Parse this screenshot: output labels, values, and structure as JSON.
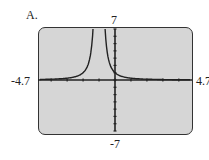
{
  "panel_label": "A.",
  "window": {
    "xmin": "-4.7",
    "xmax": "4.7",
    "ymin": "-7",
    "ymax": "7"
  },
  "colors": {
    "screen_bg": "#d6d6d6",
    "curve": "#222222"
  },
  "chart_data": {
    "type": "line",
    "title": "A.",
    "xlabel": "",
    "ylabel": "",
    "xlim": [
      -4.7,
      4.7
    ],
    "ylim": [
      -7,
      7
    ],
    "tick_labels": {
      "x": [
        "-4.7",
        "4.7"
      ],
      "y": [
        "7",
        "-7"
      ]
    },
    "grid": false,
    "function": "y = 1/(x+1)^2",
    "vertical_asymptote": -1,
    "series": [
      {
        "name": "curve",
        "x": [
          -4.7,
          -3,
          -2,
          -1.5,
          -1.35,
          -0.65,
          -0.5,
          0,
          1,
          2,
          3,
          4.7
        ],
        "y": [
          0.07,
          0.25,
          1,
          4,
          8.2,
          8.2,
          4,
          1,
          0.25,
          0.11,
          0.06,
          0.03
        ]
      }
    ]
  }
}
